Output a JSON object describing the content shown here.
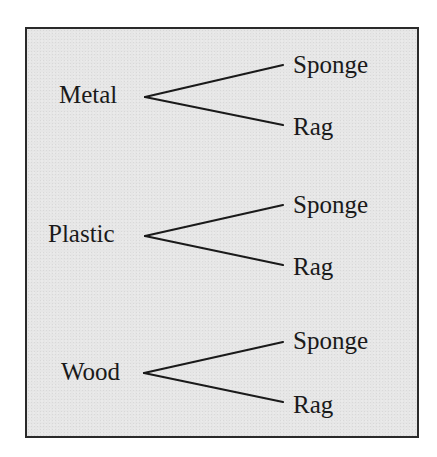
{
  "diagram": {
    "type": "tree",
    "colors": {
      "background": "#e6e6e6",
      "border": "#2a2a2a",
      "text": "#1a1a1a"
    },
    "groups": [
      {
        "label": "Metal",
        "branches": [
          "Sponge",
          "Rag"
        ]
      },
      {
        "label": "Plastic",
        "branches": [
          "Sponge",
          "Rag"
        ]
      },
      {
        "label": "Wood",
        "branches": [
          "Sponge",
          "Rag"
        ]
      }
    ]
  }
}
